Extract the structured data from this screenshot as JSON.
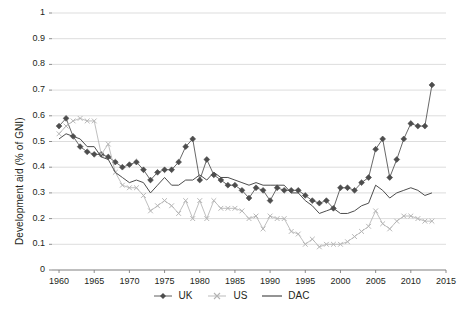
{
  "chart_data": {
    "type": "line",
    "title": "",
    "xlabel": "",
    "ylabel": "Development aid (% of GNI)",
    "xlim": [
      1959,
      2015
    ],
    "ylim": [
      0,
      1
    ],
    "ytick_values": [
      0,
      0.1,
      0.2,
      0.3,
      0.4,
      0.5,
      0.6,
      0.7,
      0.8,
      0.9,
      1
    ],
    "ytick_labels": [
      "0",
      "0.1",
      "0.2",
      "0.3",
      "0.4",
      "0.5",
      "0.6",
      "0.7",
      "0.8",
      "0.9",
      "1"
    ],
    "xtick_values": [
      1960,
      1965,
      1970,
      1975,
      1980,
      1985,
      1990,
      1995,
      2000,
      2005,
      2010,
      2015
    ],
    "xtick_labels": [
      "1960",
      "1965",
      "1970",
      "1975",
      "1980",
      "1985",
      "1990",
      "1995",
      "2000",
      "2005",
      "2010",
      "2015"
    ],
    "grid": "horizontal",
    "legend_position": "bottom",
    "x": [
      1960,
      1961,
      1962,
      1963,
      1964,
      1965,
      1966,
      1967,
      1968,
      1969,
      1970,
      1971,
      1972,
      1973,
      1974,
      1975,
      1976,
      1977,
      1978,
      1979,
      1980,
      1981,
      1982,
      1983,
      1984,
      1985,
      1986,
      1987,
      1988,
      1989,
      1990,
      1991,
      1992,
      1993,
      1994,
      1995,
      1996,
      1997,
      1998,
      1999,
      2000,
      2001,
      2002,
      2003,
      2004,
      2005,
      2006,
      2007,
      2008,
      2009,
      2010,
      2011,
      2012,
      2013
    ],
    "series": [
      {
        "name": "UK",
        "marker": "diamond",
        "color": "#4d4d4d",
        "values": [
          0.56,
          0.59,
          0.52,
          0.48,
          0.46,
          0.45,
          0.45,
          0.44,
          0.42,
          0.4,
          0.41,
          0.42,
          0.39,
          0.35,
          0.38,
          0.39,
          0.39,
          0.42,
          0.48,
          0.51,
          0.35,
          0.43,
          0.37,
          0.35,
          0.33,
          0.33,
          0.31,
          0.28,
          0.32,
          0.31,
          0.27,
          0.32,
          0.31,
          0.31,
          0.31,
          0.29,
          0.27,
          0.26,
          0.27,
          0.24,
          0.32,
          0.32,
          0.31,
          0.34,
          0.36,
          0.47,
          0.51,
          0.36,
          0.43,
          0.51,
          0.57,
          0.56,
          0.56,
          0.72
        ]
      },
      {
        "name": "US",
        "marker": "x",
        "color": "#b3b3b3",
        "values": [
          0.53,
          0.56,
          0.58,
          0.59,
          0.58,
          0.58,
          0.45,
          0.49,
          0.38,
          0.33,
          0.32,
          0.32,
          0.29,
          0.23,
          0.25,
          0.27,
          0.25,
          0.22,
          0.27,
          0.2,
          0.27,
          0.2,
          0.27,
          0.24,
          0.24,
          0.24,
          0.23,
          0.2,
          0.21,
          0.16,
          0.21,
          0.2,
          0.2,
          0.15,
          0.14,
          0.1,
          0.12,
          0.09,
          0.1,
          0.1,
          0.1,
          0.11,
          0.13,
          0.15,
          0.17,
          0.23,
          0.18,
          0.16,
          0.19,
          0.21,
          0.21,
          0.2,
          0.19,
          0.19
        ]
      },
      {
        "name": "DAC",
        "marker": "none",
        "color": "#4d4d4d",
        "values": [
          0.51,
          0.53,
          0.52,
          0.51,
          0.48,
          0.48,
          0.44,
          0.43,
          0.38,
          0.36,
          0.34,
          0.35,
          0.34,
          0.3,
          0.33,
          0.36,
          0.33,
          0.33,
          0.35,
          0.35,
          0.37,
          0.35,
          0.38,
          0.36,
          0.36,
          0.35,
          0.34,
          0.33,
          0.34,
          0.33,
          0.33,
          0.33,
          0.33,
          0.3,
          0.3,
          0.27,
          0.25,
          0.22,
          0.23,
          0.24,
          0.22,
          0.22,
          0.23,
          0.25,
          0.26,
          0.33,
          0.31,
          0.28,
          0.3,
          0.31,
          0.32,
          0.31,
          0.29,
          0.3
        ]
      }
    ]
  },
  "legend": {
    "entries": [
      {
        "label": "UK",
        "marker": "diamond-marker-icon"
      },
      {
        "label": "US",
        "marker": "x-marker-icon"
      },
      {
        "label": "DAC",
        "marker": "line-marker-icon"
      }
    ]
  },
  "colors": {
    "uk": "#4d4d4d",
    "us": "#b3b3b3",
    "dac": "#4d4d4d",
    "grid": "#d9d9d9",
    "axis": "#808080",
    "text": "#231f20"
  }
}
